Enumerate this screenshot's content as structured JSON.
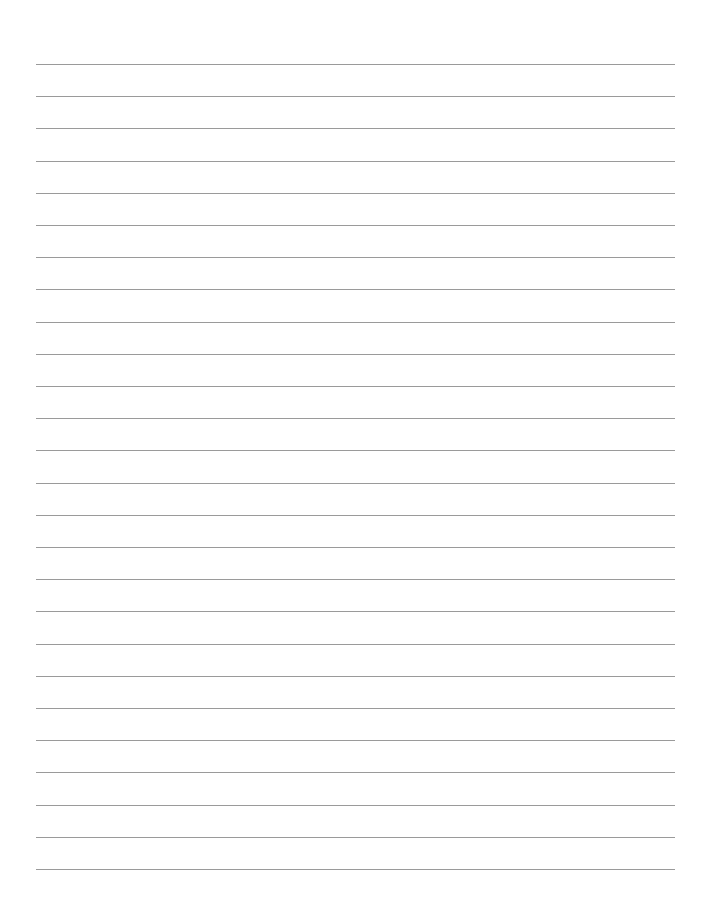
{
  "page": {
    "type": "lined-paper",
    "background_color": "#ffffff",
    "line_color": "#9a9a9a",
    "line_count": 26,
    "line_left": 36,
    "line_right": 675,
    "first_line_y": 64,
    "line_spacing": 32.2
  }
}
